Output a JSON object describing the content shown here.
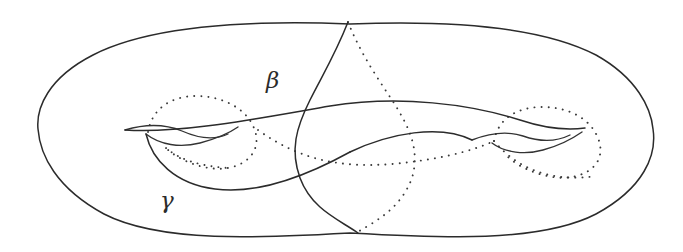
{
  "figure": {
    "kind": "line-drawing",
    "background_color": "#ffffff",
    "stroke_color": "#2b2b2b",
    "hidden_stroke_color": "#3a3a3a",
    "canvas": {
      "width": 683,
      "height": 252
    },
    "labels": [
      {
        "id": "beta",
        "text": "β",
        "x": 266,
        "y": 88,
        "style": "italic-greek"
      },
      {
        "id": "gamma",
        "text": "γ",
        "x": 160,
        "y": 208,
        "style": "italic-greek"
      }
    ],
    "paths": {
      "outer_boundary": "M 350 24 C 250 20 150 26 93 55 C 48 78 36 108 38 129 C 40 155 56 188 104 214 C 160 243 260 238 350 233 C 440 238 540 243 596 214 C 644 188 657 155 653 129 C 651 108 637 78 596 55 C 540 26 450 20 350 24 Z",
      "left_handle_upper": "M 125 130 C 145 124 165 124 182 131 C 200 139 215 140 228 134",
      "left_handle_lower": "M 146 134 C 160 145 180 148 200 143 C 215 139 228 134 238 127",
      "right_handle_upper": "M 472 140 C 490 133 508 131 523 136 C 540 142 556 142 570 135",
      "right_handle_lower": "M 492 143 C 505 153 525 155 543 150 C 558 146 572 139 582 132",
      "gamma_main": "M 125 130 C 180 134 260 118 330 106 C 400 95 470 104 520 120 C 550 130 570 130 585 128",
      "gamma_lower_loop": "M 146 134 C 152 160 175 184 215 189 C 260 195 310 174 350 152",
      "gamma_right_tail": "M 350 152 C 390 133 440 124 472 140",
      "beta_front": "M 348 22 C 335 55 322 76 310 100 C 296 128 290 150 300 178 C 312 210 340 220 358 233",
      "beta_back_dotted": "M 348 22 C 360 52 376 76 392 100 C 410 128 420 150 412 178 C 400 210 374 222 356 233",
      "left_hole_dotted": "M 148 132 C 152 108 172 96 196 96 C 222 96 246 108 254 128 C 262 148 250 164 228 168 C 206 172 178 160 166 148",
      "left_hole_dotted_tail": "M 166 148 C 180 160 200 166 228 168",
      "right_hole_dotted": "M 494 141 C 498 118 518 107 542 107 C 568 107 590 118 598 138 C 606 158 594 173 572 177 C 548 181 518 168 506 155"
    },
    "dot_paths": {
      "back_curve_left": "M 258 130 C 300 160 340 168 392 164 C 436 160 470 152 494 141",
      "back_curve_right": "M 494 141 C 520 172 556 182 596 176"
    }
  }
}
